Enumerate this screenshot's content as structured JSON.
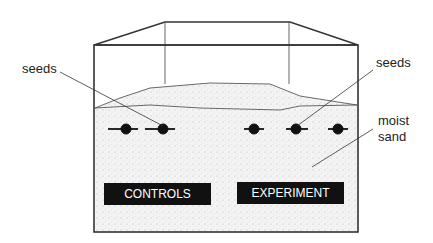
{
  "labels": {
    "seeds_left": "seeds",
    "seeds_right": "seeds",
    "moist": "moist",
    "sand": "sand",
    "controls": "CONTROLS",
    "experiment": "EXPERIMENT"
  },
  "seeds": {
    "controls_count": 2,
    "experiment_count": 3
  },
  "colors": {
    "stroke": "#333333",
    "sand": "#f1f1f1",
    "label_bg": "#111111",
    "label_text": "#ffffff"
  }
}
